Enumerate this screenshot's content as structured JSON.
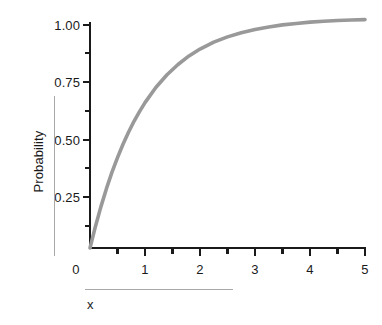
{
  "chart_data": {
    "type": "line",
    "title": "",
    "subtitle": "",
    "xlabel": "x",
    "ylabel": "Probability",
    "xlim": [
      0,
      5
    ],
    "ylim": [
      0,
      1.04
    ],
    "grid": false,
    "legend": null,
    "legend_position": "none",
    "curve_color": "#999999",
    "axis_color": "#1a1a1a",
    "rule_color": "#a8a8a8",
    "function": "1 - exp(-x)",
    "x_ticks": [
      "0",
      "1",
      "2",
      "3",
      "4",
      "5"
    ],
    "x_tick_values": [
      0,
      1,
      2,
      3,
      4,
      5
    ],
    "x_minor_tick_values": [
      0.5,
      1.5,
      2.5,
      3.5,
      4.5
    ],
    "y_ticks": [
      "0.25",
      "0.50",
      "0.75",
      "1.00"
    ],
    "y_tick_values": [
      0.25,
      0.5,
      0.75,
      1.0
    ],
    "y_minor_tick_values": [
      0.125,
      0.375,
      0.625,
      0.875
    ],
    "x": [
      0,
      0.1,
      0.2,
      0.3,
      0.4,
      0.5,
      0.6,
      0.7,
      0.8,
      0.9,
      1.0,
      1.2,
      1.4,
      1.6,
      1.8,
      2.0,
      2.25,
      2.5,
      2.75,
      3.0,
      3.25,
      3.5,
      3.75,
      4.0,
      4.25,
      4.5,
      4.75,
      5.0
    ],
    "values": [
      0.0,
      0.095,
      0.181,
      0.259,
      0.33,
      0.393,
      0.451,
      0.503,
      0.551,
      0.593,
      0.632,
      0.699,
      0.753,
      0.798,
      0.835,
      0.865,
      0.895,
      0.918,
      0.936,
      0.95,
      0.961,
      0.97,
      0.976,
      0.982,
      0.986,
      0.989,
      0.991,
      0.993
    ],
    "series": [
      {
        "name": "Probability",
        "color": "#999999",
        "x": [
          0,
          0.1,
          0.2,
          0.3,
          0.4,
          0.5,
          0.6,
          0.7,
          0.8,
          0.9,
          1.0,
          1.2,
          1.4,
          1.6,
          1.8,
          2.0,
          2.25,
          2.5,
          2.75,
          3.0,
          3.25,
          3.5,
          3.75,
          4.0,
          4.25,
          4.5,
          4.75,
          5.0
        ],
        "values": [
          0.0,
          0.095,
          0.181,
          0.259,
          0.33,
          0.393,
          0.451,
          0.503,
          0.551,
          0.593,
          0.632,
          0.699,
          0.753,
          0.798,
          0.835,
          0.865,
          0.895,
          0.918,
          0.936,
          0.95,
          0.961,
          0.97,
          0.976,
          0.982,
          0.986,
          0.989,
          0.991,
          0.993
        ]
      }
    ]
  },
  "axes": {
    "y_labels": [
      "1.00",
      "0.75",
      "0.50",
      "0.25"
    ],
    "x_labels": [
      "0",
      "1",
      "2",
      "3",
      "4",
      "5"
    ],
    "y_axis_title": "Probability",
    "x_axis_title": "x"
  }
}
